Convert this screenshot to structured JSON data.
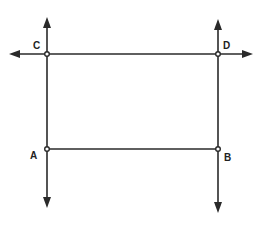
{
  "diagram": {
    "type": "geometry-lines",
    "stroke_color": "#2a2a2a",
    "background": "#ffffff",
    "points": [
      {
        "id": "C",
        "label": "C",
        "x": 47,
        "y": 54,
        "label_x": 33,
        "label_y": 41
      },
      {
        "id": "D",
        "label": "D",
        "x": 218,
        "y": 54,
        "label_x": 223,
        "label_y": 41
      },
      {
        "id": "A",
        "label": "A",
        "x": 47,
        "y": 149,
        "label_x": 30,
        "label_y": 151
      },
      {
        "id": "B",
        "label": "B",
        "x": 218,
        "y": 149,
        "label_x": 224,
        "label_y": 153
      }
    ],
    "lines": [
      {
        "name": "line-CA",
        "kind": "line",
        "from": [
          47,
          18
        ],
        "to": [
          47,
          207
        ],
        "arrows": "both"
      },
      {
        "name": "line-DB",
        "kind": "line",
        "from": [
          218,
          20
        ],
        "to": [
          218,
          212
        ],
        "arrows": "both"
      },
      {
        "name": "line-CD",
        "kind": "line",
        "from": [
          10,
          54
        ],
        "to": [
          252,
          54
        ],
        "arrows": "both"
      },
      {
        "name": "segment-AB",
        "kind": "segment",
        "from": [
          47,
          149
        ],
        "to": [
          218,
          149
        ],
        "arrows": "none"
      }
    ]
  }
}
